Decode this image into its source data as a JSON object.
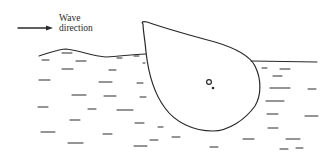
{
  "diagram": {
    "labels": {
      "wave_direction_line1": "Wave",
      "wave_direction_line2": "direction"
    },
    "elements": [
      {
        "id": "wave-arrow",
        "type": "arrow",
        "direction": "right",
        "meaning": "incoming wave direction"
      },
      {
        "id": "water-surface-left",
        "type": "wavy-line",
        "meaning": "disturbed water surface upwave of hull"
      },
      {
        "id": "water-surface-right",
        "type": "straight-line",
        "meaning": "calm water surface in lee of hull"
      },
      {
        "id": "hull-section",
        "type": "teardrop-outline",
        "meaning": "floating body cross-section"
      },
      {
        "id": "center-of-gravity",
        "type": "open-circle",
        "meaning": "reference point (centre)"
      },
      {
        "id": "center-of-buoyancy",
        "type": "filled-dot",
        "meaning": "reference point (buoyancy)"
      },
      {
        "id": "water-hatching",
        "type": "dash-pattern",
        "meaning": "water body"
      }
    ],
    "colors": {
      "ink": "#2a2a2a",
      "background": "#ffffff"
    }
  }
}
